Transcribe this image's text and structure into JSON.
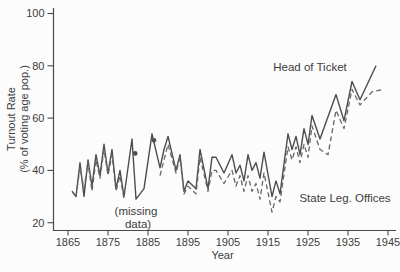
{
  "figure": {
    "background": "#fcfcfc",
    "text_color": "#3d3d3d",
    "axis_color": "#4a4a4a",
    "solid_line_color": "#4d4d4d",
    "dashed_line_color": "#666666"
  },
  "chart_data": {
    "type": "line",
    "title": "",
    "xlabel": "Year",
    "ylabel_line1": "Turnout Rate",
    "ylabel_line2": "(% of voting age pop.)",
    "x_ticks": [
      1865,
      1875,
      1885,
      1895,
      1905,
      1915,
      1925,
      1935,
      1945
    ],
    "y_ticks": [
      20,
      40,
      60,
      80,
      100
    ],
    "xlim": [
      1861.4,
      1947
    ],
    "ylim": [
      17,
      102
    ],
    "grid": false,
    "legend_position": "inline-annotations",
    "series": [
      {
        "name": "Head of Ticket",
        "style": "solid",
        "points": [
          [
            1866,
            32
          ],
          [
            1867,
            30
          ],
          [
            1868,
            43
          ],
          [
            1869,
            30
          ],
          [
            1870,
            44
          ],
          [
            1871,
            34
          ],
          [
            1872,
            46
          ],
          [
            1873,
            38
          ],
          [
            1874,
            50
          ],
          [
            1875,
            39
          ],
          [
            1876,
            48
          ],
          [
            1877,
            33
          ],
          [
            1878,
            40
          ],
          [
            1879,
            30
          ],
          [
            1881,
            52
          ],
          [
            1882,
            29
          ],
          [
            1884,
            33
          ],
          [
            1886,
            54
          ],
          [
            1888,
            41
          ],
          [
            1889,
            48
          ],
          [
            1890,
            53
          ],
          [
            1892,
            40
          ],
          [
            1893,
            46
          ],
          [
            1894,
            32
          ],
          [
            1895,
            36
          ],
          [
            1897,
            33
          ],
          [
            1898,
            48
          ],
          [
            1900,
            33
          ],
          [
            1901,
            45
          ],
          [
            1902,
            45
          ],
          [
            1904,
            39
          ],
          [
            1906,
            46
          ],
          [
            1907,
            39
          ],
          [
            1908,
            42
          ],
          [
            1909,
            36
          ],
          [
            1910,
            46
          ],
          [
            1911,
            40
          ],
          [
            1912,
            43
          ],
          [
            1913,
            37
          ],
          [
            1914,
            47
          ],
          [
            1916,
            30
          ],
          [
            1917,
            36
          ],
          [
            1918,
            31
          ],
          [
            1920,
            54
          ],
          [
            1921,
            48
          ],
          [
            1922,
            53
          ],
          [
            1923,
            46
          ],
          [
            1924,
            56
          ],
          [
            1925,
            50
          ],
          [
            1926,
            61
          ],
          [
            1928,
            52
          ],
          [
            1932,
            69
          ],
          [
            1934,
            59
          ],
          [
            1936,
            74
          ],
          [
            1938,
            67
          ],
          [
            1942,
            80
          ]
        ]
      },
      {
        "name": "State Leg. Offices",
        "style": "dashed",
        "segments": [
          [
            [
              1867,
              30
            ],
            [
              1868,
              41
            ],
            [
              1869,
              33
            ],
            [
              1870,
              43
            ],
            [
              1871,
              32
            ],
            [
              1872,
              44
            ],
            [
              1873,
              37
            ],
            [
              1874,
              48
            ],
            [
              1875,
              38
            ],
            [
              1876,
              46
            ],
            [
              1877,
              32
            ],
            [
              1878,
              38
            ],
            [
              1879,
              29
            ]
          ],
          [
            [
              1888,
              38
            ],
            [
              1890,
              50
            ],
            [
              1892,
              39
            ],
            [
              1893,
              45
            ],
            [
              1894,
              31
            ],
            [
              1895,
              34
            ],
            [
              1897,
              31
            ],
            [
              1898,
              45
            ],
            [
              1900,
              32
            ],
            [
              1901,
              40
            ],
            [
              1902,
              40
            ],
            [
              1904,
              35
            ],
            [
              1906,
              40
            ],
            [
              1907,
              34
            ],
            [
              1908,
              38
            ],
            [
              1909,
              32
            ],
            [
              1910,
              38
            ],
            [
              1911,
              32
            ],
            [
              1912,
              35
            ],
            [
              1913,
              29
            ],
            [
              1914,
              39
            ],
            [
              1916,
              24
            ],
            [
              1917,
              30
            ],
            [
              1918,
              28
            ],
            [
              1920,
              49
            ],
            [
              1921,
              44
            ],
            [
              1922,
              49
            ],
            [
              1923,
              43
            ],
            [
              1924,
              50
            ],
            [
              1925,
              45
            ],
            [
              1926,
              57
            ],
            [
              1928,
              48
            ],
            [
              1930,
              46
            ],
            [
              1932,
              63
            ],
            [
              1934,
              56
            ],
            [
              1936,
              71
            ],
            [
              1938,
              65
            ],
            [
              1941,
              70
            ],
            [
              1944,
              71
            ]
          ]
        ],
        "isolated_points": [
          [
            1881.8,
            46.5
          ],
          [
            1886.5,
            51.5
          ]
        ]
      }
    ],
    "annotations": [
      {
        "id": "head-of-ticket-label",
        "text": "Head of Ticket",
        "year": 1925.5,
        "value": 79.5
      },
      {
        "id": "state-leg-label",
        "text": "State Leg. Offices",
        "year": 1934.25,
        "value": 29.4
      },
      {
        "id": "missing-data-line1",
        "text": "(missing",
        "year": 1882.0,
        "value": 24.5
      },
      {
        "id": "missing-data-line2",
        "text": "data)",
        "year": 1882.5,
        "value": 19.5
      }
    ]
  }
}
